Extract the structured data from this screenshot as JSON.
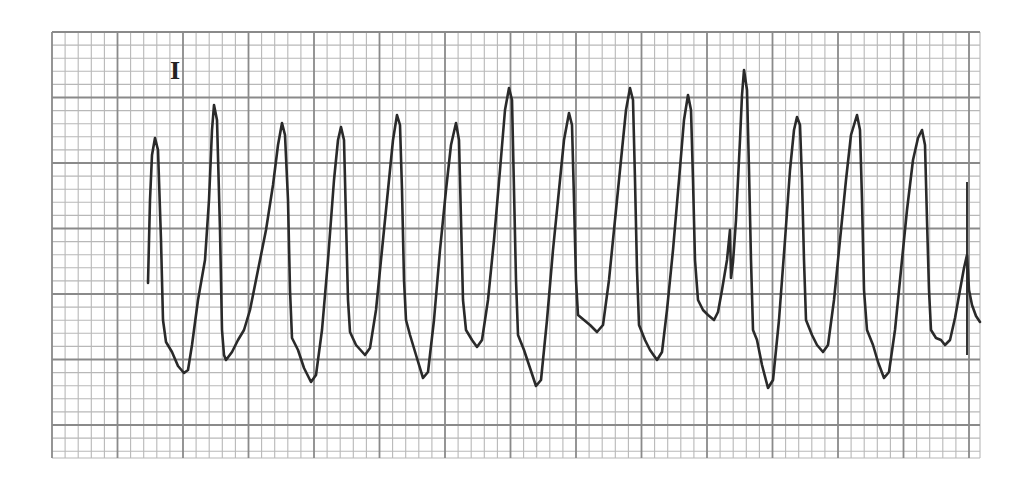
{
  "strip": {
    "lead_label": "I",
    "paper_color": "#ffffff",
    "grid_minor_color": "#b8b8b8",
    "grid_major_color": "#8a8a8a",
    "trace_color": "#2a2a2a"
  },
  "chart_data": {
    "type": "line",
    "title": "",
    "subtitle": "Lead I ECG rhythm strip",
    "xlabel": "",
    "ylabel": "",
    "grid": true,
    "legend": [],
    "annotations": [
      "I"
    ],
    "grid_px": {
      "left": 52,
      "top": 32,
      "right": 980,
      "bottom": 458,
      "minor": 13.1,
      "major": 65.5
    },
    "points": [
      [
        148,
        283
      ],
      [
        150,
        200
      ],
      [
        152,
        155
      ],
      [
        155,
        138
      ],
      [
        158,
        150
      ],
      [
        161,
        240
      ],
      [
        163,
        320
      ],
      [
        166,
        342
      ],
      [
        172,
        352
      ],
      [
        178,
        366
      ],
      [
        184,
        373
      ],
      [
        188,
        370
      ],
      [
        192,
        345
      ],
      [
        198,
        300
      ],
      [
        205,
        260
      ],
      [
        209,
        200
      ],
      [
        212,
        130
      ],
      [
        214,
        105
      ],
      [
        217,
        120
      ],
      [
        220,
        230
      ],
      [
        222,
        330
      ],
      [
        224,
        355
      ],
      [
        226,
        360
      ],
      [
        232,
        352
      ],
      [
        238,
        340
      ],
      [
        244,
        330
      ],
      [
        250,
        310
      ],
      [
        258,
        270
      ],
      [
        266,
        230
      ],
      [
        273,
        185
      ],
      [
        278,
        145
      ],
      [
        282,
        123
      ],
      [
        285,
        135
      ],
      [
        288,
        200
      ],
      [
        290,
        290
      ],
      [
        292,
        338
      ],
      [
        298,
        350
      ],
      [
        304,
        368
      ],
      [
        311,
        382
      ],
      [
        316,
        375
      ],
      [
        322,
        330
      ],
      [
        328,
        260
      ],
      [
        334,
        180
      ],
      [
        338,
        140
      ],
      [
        341,
        127
      ],
      [
        344,
        140
      ],
      [
        346,
        220
      ],
      [
        348,
        300
      ],
      [
        350,
        332
      ],
      [
        356,
        345
      ],
      [
        365,
        355
      ],
      [
        370,
        348
      ],
      [
        376,
        310
      ],
      [
        382,
        250
      ],
      [
        388,
        190
      ],
      [
        393,
        140
      ],
      [
        397,
        115
      ],
      [
        400,
        125
      ],
      [
        402,
        190
      ],
      [
        404,
        280
      ],
      [
        406,
        320
      ],
      [
        410,
        335
      ],
      [
        416,
        355
      ],
      [
        423,
        378
      ],
      [
        428,
        372
      ],
      [
        434,
        320
      ],
      [
        440,
        250
      ],
      [
        446,
        190
      ],
      [
        451,
        145
      ],
      [
        456,
        123
      ],
      [
        459,
        140
      ],
      [
        461,
        220
      ],
      [
        463,
        300
      ],
      [
        466,
        330
      ],
      [
        472,
        340
      ],
      [
        477,
        347
      ],
      [
        482,
        340
      ],
      [
        488,
        300
      ],
      [
        494,
        240
      ],
      [
        500,
        170
      ],
      [
        505,
        110
      ],
      [
        509,
        88
      ],
      [
        512,
        100
      ],
      [
        514,
        190
      ],
      [
        516,
        280
      ],
      [
        518,
        335
      ],
      [
        524,
        350
      ],
      [
        530,
        368
      ],
      [
        536,
        386
      ],
      [
        541,
        380
      ],
      [
        547,
        320
      ],
      [
        553,
        250
      ],
      [
        559,
        190
      ],
      [
        564,
        140
      ],
      [
        569,
        113
      ],
      [
        572,
        125
      ],
      [
        574,
        200
      ],
      [
        576,
        280
      ],
      [
        578,
        315
      ],
      [
        584,
        320
      ],
      [
        590,
        325
      ],
      [
        597,
        332
      ],
      [
        603,
        325
      ],
      [
        609,
        280
      ],
      [
        615,
        220
      ],
      [
        621,
        160
      ],
      [
        626,
        110
      ],
      [
        630,
        88
      ],
      [
        633,
        100
      ],
      [
        635,
        180
      ],
      [
        637,
        270
      ],
      [
        639,
        325
      ],
      [
        645,
        340
      ],
      [
        650,
        350
      ],
      [
        657,
        360
      ],
      [
        662,
        352
      ],
      [
        667,
        310
      ],
      [
        673,
        250
      ],
      [
        679,
        180
      ],
      [
        684,
        120
      ],
      [
        688,
        95
      ],
      [
        691,
        110
      ],
      [
        693,
        180
      ],
      [
        695,
        260
      ],
      [
        698,
        300
      ],
      [
        703,
        310
      ],
      [
        708,
        315
      ],
      [
        714,
        320
      ],
      [
        718,
        312
      ],
      [
        722,
        290
      ],
      [
        727,
        260
      ],
      [
        729,
        240
      ],
      [
        730,
        230
      ],
      [
        731,
        278
      ],
      [
        733,
        262
      ],
      [
        736,
        220
      ],
      [
        740,
        140
      ],
      [
        742,
        95
      ],
      [
        744,
        70
      ],
      [
        747,
        90
      ],
      [
        749,
        170
      ],
      [
        751,
        260
      ],
      [
        753,
        330
      ],
      [
        757,
        340
      ],
      [
        762,
        365
      ],
      [
        768,
        388
      ],
      [
        773,
        380
      ],
      [
        779,
        320
      ],
      [
        785,
        240
      ],
      [
        790,
        170
      ],
      [
        794,
        130
      ],
      [
        797,
        117
      ],
      [
        800,
        125
      ],
      [
        802,
        180
      ],
      [
        804,
        260
      ],
      [
        806,
        320
      ],
      [
        812,
        335
      ],
      [
        817,
        345
      ],
      [
        823,
        352
      ],
      [
        828,
        345
      ],
      [
        834,
        300
      ],
      [
        840,
        240
      ],
      [
        846,
        180
      ],
      [
        851,
        135
      ],
      [
        857,
        115
      ],
      [
        860,
        130
      ],
      [
        862,
        200
      ],
      [
        864,
        290
      ],
      [
        867,
        330
      ],
      [
        873,
        345
      ],
      [
        878,
        362
      ],
      [
        884,
        378
      ],
      [
        889,
        372
      ],
      [
        895,
        330
      ],
      [
        901,
        270
      ],
      [
        907,
        210
      ],
      [
        913,
        160
      ],
      [
        918,
        138
      ],
      [
        922,
        130
      ],
      [
        925,
        145
      ],
      [
        927,
        220
      ],
      [
        929,
        290
      ],
      [
        931,
        330
      ],
      [
        936,
        338
      ],
      [
        941,
        340
      ],
      [
        945,
        345
      ],
      [
        950,
        340
      ],
      [
        955,
        318
      ],
      [
        960,
        290
      ],
      [
        964,
        268
      ],
      [
        967,
        255
      ],
      [
        969,
        290
      ],
      [
        972,
        305
      ],
      [
        976,
        316
      ],
      [
        980,
        322
      ]
    ],
    "peaks": [
      {
        "x": 155,
        "y": 138
      },
      {
        "x": 214,
        "y": 105
      },
      {
        "x": 282,
        "y": 123
      },
      {
        "x": 341,
        "y": 127
      },
      {
        "x": 397,
        "y": 115
      },
      {
        "x": 456,
        "y": 123
      },
      {
        "x": 509,
        "y": 88
      },
      {
        "x": 569,
        "y": 113
      },
      {
        "x": 630,
        "y": 88
      },
      {
        "x": 688,
        "y": 95
      },
      {
        "x": 744,
        "y": 70
      },
      {
        "x": 797,
        "y": 117
      },
      {
        "x": 857,
        "y": 115
      },
      {
        "x": 922,
        "y": 130
      }
    ],
    "troughs": [
      {
        "x": 184,
        "y": 373
      },
      {
        "x": 226,
        "y": 360
      },
      {
        "x": 311,
        "y": 382
      },
      {
        "x": 365,
        "y": 355
      },
      {
        "x": 423,
        "y": 378
      },
      {
        "x": 477,
        "y": 347
      },
      {
        "x": 536,
        "y": 386
      },
      {
        "x": 597,
        "y": 332
      },
      {
        "x": 657,
        "y": 360
      },
      {
        "x": 714,
        "y": 320
      },
      {
        "x": 768,
        "y": 388
      },
      {
        "x": 823,
        "y": 352
      },
      {
        "x": 884,
        "y": 378
      },
      {
        "x": 945,
        "y": 345
      }
    ],
    "marker_line_x": 967
  }
}
